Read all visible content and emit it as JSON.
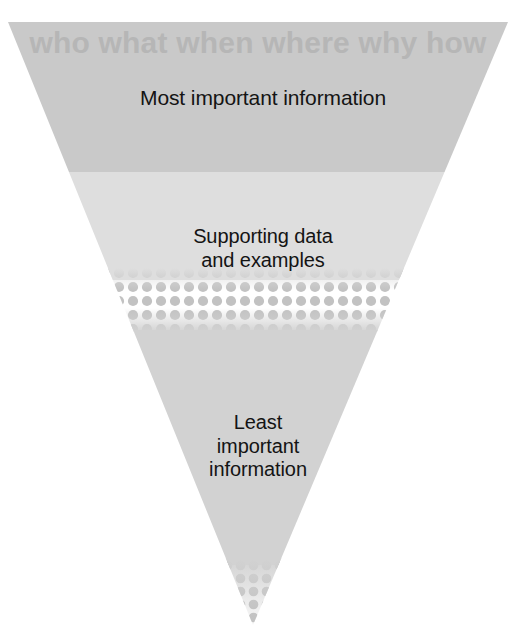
{
  "diagram": {
    "name": "inverted-pyramid",
    "background_color": "#ffffff",
    "apex": {
      "x": 253,
      "y": 625
    },
    "top_left": {
      "x": 8,
      "y": 22
    },
    "top_right": {
      "x": 508,
      "y": 22
    }
  },
  "header": {
    "questions": "who what when where why how",
    "color": "#b6b6b6"
  },
  "tiers": [
    {
      "id": "tier-1",
      "label": "Most important information",
      "band_color": "#c9c9c9",
      "y_start": 22,
      "y_end": 170
    },
    {
      "id": "tier-2",
      "label": "Supporting data\nand examples",
      "band_color": "#dedede",
      "y_start": 170,
      "y_end": 275
    },
    {
      "id": "tier-3",
      "label": "Least\nimportant\ninformation",
      "band_color": "#d2d2d2",
      "y_start": 325,
      "y_end": 625
    }
  ],
  "textures": {
    "halftone_upper": {
      "y_start": 275,
      "y_end": 325,
      "dot_color": "#c4c4c4"
    },
    "halftone_apex": {
      "y_start": 560,
      "y_end": 625,
      "dot_color": "#c0c0c0"
    }
  },
  "colors": {
    "text": "#141414",
    "band_dark": "#c9c9c9",
    "band_light": "#dedede",
    "band_body": "#d2d2d2",
    "header_text": "#b6b6b6",
    "background": "#ffffff"
  }
}
